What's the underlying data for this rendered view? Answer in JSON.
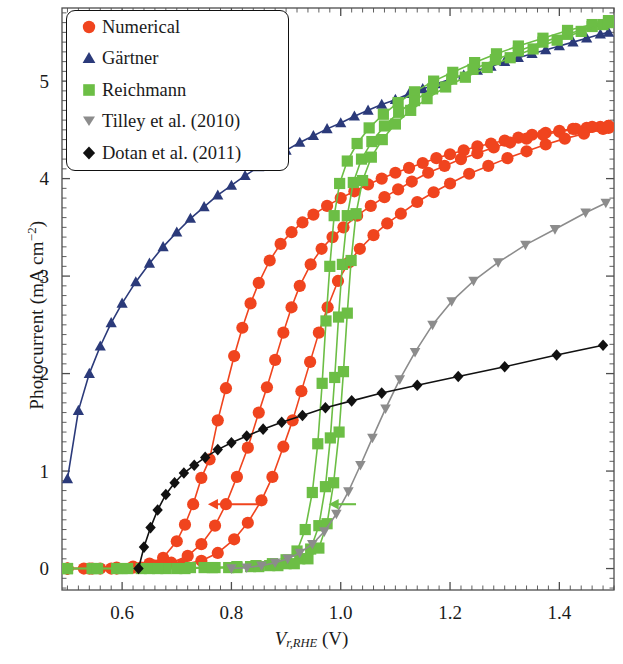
{
  "figure": {
    "kind": "scientific-plot",
    "background": "#ffffff",
    "frame_color": "#4d4d4d"
  },
  "axes": {
    "xlabel_prefix": "V",
    "xlabel_sub": "r,RHE",
    "xlabel_unit": "(V)",
    "ylabel_prefix": "Photocurrent (mA cm",
    "ylabel_sup": "−2",
    "ylabel_suffix": ")",
    "xticks": [
      "0.6",
      "0.8",
      "1.0",
      "1.2",
      "1.4"
    ],
    "yticks": [
      "0",
      "1",
      "2",
      "3",
      "4",
      "5"
    ]
  },
  "legend": {
    "items": [
      {
        "label": "Numerical",
        "marker": "circle-marker",
        "color": "#f0441e"
      },
      {
        "label": "Gärtner",
        "marker": "triangle-up-marker",
        "color": "#2b3a7a"
      },
      {
        "label": "Reichmann",
        "marker": "square-marker",
        "color": "#6cbe45"
      },
      {
        "label": "Tilley et al. (2010)",
        "marker": "triangle-down-marker",
        "color": "#8c8c8c"
      },
      {
        "label": "Dotan et al. (2011)",
        "marker": "diamond-marker",
        "color": "#111111"
      }
    ]
  },
  "chart_data": {
    "type": "line",
    "title": "",
    "xlabel": "V_{r,RHE} (V)",
    "ylabel": "Photocurrent (mA cm^-2)",
    "xlim": [
      0.49,
      1.5
    ],
    "ylim": [
      -0.22,
      5.75
    ],
    "grid": false,
    "legend_position": "top-left",
    "annotations": [
      {
        "name": "red-shift-arrow",
        "type": "arrow-left",
        "color": "#f0441e",
        "x_from": 0.862,
        "x_to": 0.757,
        "y": 0.66
      },
      {
        "name": "green-shift-arrow",
        "type": "arrow-left",
        "color": "#6cbe45",
        "x_from": 1.028,
        "x_to": 0.978,
        "y": 0.66
      }
    ],
    "series": [
      {
        "name": "Gärtner",
        "marker": "triangle-up-marker",
        "color": "#2b3a7a",
        "x": [
          0.5,
          0.52,
          0.54,
          0.56,
          0.58,
          0.6,
          0.625,
          0.65,
          0.675,
          0.7,
          0.725,
          0.75,
          0.775,
          0.8,
          0.825,
          0.85,
          0.875,
          0.9,
          0.925,
          0.95,
          0.975,
          1.0,
          1.025,
          1.05,
          1.075,
          1.1,
          1.125,
          1.15,
          1.175,
          1.2,
          1.225,
          1.25,
          1.275,
          1.3,
          1.325,
          1.35,
          1.375,
          1.4,
          1.425,
          1.45,
          1.475,
          1.49
        ],
        "y": [
          0.92,
          1.62,
          2.0,
          2.28,
          2.52,
          2.72,
          2.94,
          3.13,
          3.3,
          3.45,
          3.59,
          3.71,
          3.83,
          3.93,
          4.03,
          4.12,
          4.21,
          4.29,
          4.37,
          4.44,
          4.51,
          4.57,
          4.64,
          4.7,
          4.76,
          4.81,
          4.87,
          4.92,
          4.97,
          5.02,
          5.06,
          5.11,
          5.15,
          5.2,
          5.24,
          5.28,
          5.32,
          5.36,
          5.4,
          5.44,
          5.48,
          5.5
        ]
      },
      {
        "name": "Numerical-1",
        "marker": "circle-marker",
        "color": "#f0441e",
        "x": [
          0.5,
          0.53,
          0.56,
          0.59,
          0.62,
          0.65,
          0.675,
          0.7,
          0.715,
          0.73,
          0.745,
          0.76,
          0.775,
          0.79,
          0.805,
          0.82,
          0.835,
          0.85,
          0.87,
          0.89,
          0.91,
          0.93,
          0.95,
          0.975,
          1.0,
          1.025,
          1.05,
          1.075,
          1.1,
          1.125,
          1.15,
          1.175,
          1.2,
          1.225,
          1.25,
          1.275,
          1.3,
          1.325,
          1.35,
          1.375,
          1.4,
          1.425,
          1.45,
          1.475,
          1.49
        ],
        "y": [
          0.0,
          0.0,
          0.0,
          0.01,
          0.02,
          0.05,
          0.11,
          0.28,
          0.45,
          0.66,
          0.93,
          1.12,
          1.52,
          1.85,
          2.18,
          2.47,
          2.72,
          2.93,
          3.16,
          3.33,
          3.45,
          3.55,
          3.63,
          3.72,
          3.8,
          3.87,
          3.94,
          4.0,
          4.06,
          4.11,
          4.16,
          4.21,
          4.25,
          4.29,
          4.33,
          4.36,
          4.39,
          4.42,
          4.45,
          4.47,
          4.49,
          4.51,
          4.52,
          4.53,
          4.54
        ]
      },
      {
        "name": "Numerical-2",
        "marker": "circle-marker",
        "color": "#f0441e",
        "x": [
          0.5,
          0.54,
          0.58,
          0.62,
          0.66,
          0.69,
          0.72,
          0.745,
          0.77,
          0.79,
          0.81,
          0.83,
          0.85,
          0.865,
          0.88,
          0.895,
          0.91,
          0.925,
          0.945,
          0.965,
          0.985,
          1.005,
          1.03,
          1.055,
          1.08,
          1.105,
          1.13,
          1.16,
          1.19,
          1.22,
          1.25,
          1.28,
          1.31,
          1.34,
          1.37,
          1.4,
          1.43,
          1.46,
          1.49
        ],
        "y": [
          0.0,
          0.0,
          0.0,
          0.01,
          0.03,
          0.06,
          0.13,
          0.25,
          0.44,
          0.66,
          0.94,
          1.24,
          1.6,
          1.86,
          2.14,
          2.42,
          2.68,
          2.9,
          3.12,
          3.28,
          3.4,
          3.5,
          3.62,
          3.72,
          3.81,
          3.89,
          3.97,
          4.06,
          4.13,
          4.2,
          4.26,
          4.32,
          4.37,
          4.41,
          4.45,
          4.48,
          4.51,
          4.53,
          4.54
        ]
      },
      {
        "name": "Numerical-3",
        "marker": "circle-marker",
        "color": "#f0441e",
        "x": [
          0.5,
          0.545,
          0.59,
          0.635,
          0.675,
          0.71,
          0.745,
          0.775,
          0.805,
          0.83,
          0.855,
          0.875,
          0.895,
          0.912,
          0.928,
          0.944,
          0.96,
          0.976,
          0.995,
          1.015,
          1.035,
          1.06,
          1.085,
          1.11,
          1.14,
          1.17,
          1.2,
          1.235,
          1.27,
          1.305,
          1.34,
          1.375,
          1.41,
          1.445,
          1.48,
          1.49
        ],
        "y": [
          0.0,
          0.0,
          0.0,
          0.01,
          0.02,
          0.04,
          0.08,
          0.16,
          0.3,
          0.47,
          0.7,
          0.94,
          1.25,
          1.52,
          1.82,
          2.12,
          2.42,
          2.68,
          2.95,
          3.14,
          3.28,
          3.42,
          3.54,
          3.64,
          3.76,
          3.86,
          3.95,
          4.05,
          4.13,
          4.21,
          4.28,
          4.35,
          4.41,
          4.46,
          4.51,
          4.52
        ]
      },
      {
        "name": "Reichmann-1",
        "marker": "square-marker",
        "color": "#6cbe45",
        "x": [
          0.5,
          0.545,
          0.59,
          0.635,
          0.68,
          0.725,
          0.77,
          0.81,
          0.845,
          0.875,
          0.9,
          0.92,
          0.935,
          0.948,
          0.958,
          0.966,
          0.973,
          0.98,
          0.988,
          0.998,
          1.012,
          1.03,
          1.052,
          1.078,
          1.105,
          1.135,
          1.17,
          1.205,
          1.245,
          1.285,
          1.325,
          1.37,
          1.415,
          1.46,
          1.49
        ],
        "y": [
          0.0,
          0.0,
          0.0,
          0.0,
          0.0,
          0.01,
          0.01,
          0.02,
          0.03,
          0.05,
          0.09,
          0.18,
          0.4,
          0.78,
          1.28,
          1.9,
          2.54,
          3.1,
          3.62,
          3.95,
          4.18,
          4.36,
          4.52,
          4.66,
          4.78,
          4.89,
          5.0,
          5.09,
          5.19,
          5.28,
          5.36,
          5.44,
          5.52,
          5.58,
          5.62
        ]
      },
      {
        "name": "Reichmann-2",
        "marker": "square-marker",
        "color": "#6cbe45",
        "x": [
          0.5,
          0.55,
          0.6,
          0.65,
          0.7,
          0.75,
          0.795,
          0.835,
          0.87,
          0.9,
          0.925,
          0.945,
          0.96,
          0.972,
          0.981,
          0.989,
          0.996,
          1.003,
          1.012,
          1.023,
          1.038,
          1.057,
          1.08,
          1.106,
          1.135,
          1.168,
          1.203,
          1.242,
          1.283,
          1.325,
          1.37,
          1.415,
          1.46,
          1.49
        ],
        "y": [
          0.0,
          0.0,
          0.0,
          0.0,
          0.0,
          0.01,
          0.01,
          0.02,
          0.03,
          0.05,
          0.1,
          0.2,
          0.44,
          0.84,
          1.34,
          1.96,
          2.58,
          3.12,
          3.62,
          3.96,
          4.2,
          4.38,
          4.54,
          4.68,
          4.8,
          4.92,
          5.02,
          5.12,
          5.22,
          5.31,
          5.4,
          5.48,
          5.56,
          5.62
        ]
      },
      {
        "name": "Reichmann-3",
        "marker": "square-marker",
        "color": "#6cbe45",
        "x": [
          0.5,
          0.555,
          0.61,
          0.665,
          0.715,
          0.765,
          0.81,
          0.85,
          0.885,
          0.915,
          0.94,
          0.96,
          0.975,
          0.987,
          0.997,
          1.005,
          1.012,
          1.019,
          1.028,
          1.04,
          1.056,
          1.076,
          1.1,
          1.128,
          1.158,
          1.192,
          1.228,
          1.268,
          1.31,
          1.352,
          1.396,
          1.44,
          1.48,
          1.49
        ],
        "y": [
          0.0,
          0.0,
          0.0,
          0.0,
          0.0,
          0.01,
          0.01,
          0.02,
          0.03,
          0.05,
          0.1,
          0.21,
          0.46,
          0.88,
          1.4,
          2.02,
          2.62,
          3.16,
          3.64,
          3.98,
          4.22,
          4.4,
          4.56,
          4.7,
          4.82,
          4.94,
          5.04,
          5.14,
          5.24,
          5.33,
          5.42,
          5.51,
          5.58,
          5.6
        ]
      },
      {
        "name": "Tilley et al. (2010)",
        "marker": "triangle-down-marker",
        "color": "#8c8c8c",
        "x": [
          0.8,
          0.828,
          0.855,
          0.88,
          0.903,
          0.925,
          0.948,
          0.97,
          0.992,
          1.014,
          1.036,
          1.058,
          1.082,
          1.108,
          1.136,
          1.168,
          1.203,
          1.243,
          1.288,
          1.338,
          1.392,
          1.448,
          1.485
        ],
        "y": [
          0.0,
          0.01,
          0.03,
          0.06,
          0.1,
          0.16,
          0.25,
          0.38,
          0.56,
          0.79,
          1.06,
          1.34,
          1.64,
          1.94,
          2.22,
          2.5,
          2.74,
          2.95,
          3.14,
          3.32,
          3.48,
          3.65,
          3.75
        ]
      },
      {
        "name": "Dotan et al. (2011)",
        "marker": "diamond-marker",
        "color": "#111111",
        "x": [
          0.63,
          0.64,
          0.652,
          0.665,
          0.68,
          0.696,
          0.713,
          0.732,
          0.752,
          0.775,
          0.8,
          0.828,
          0.858,
          0.892,
          0.93,
          0.972,
          1.02,
          1.075,
          1.14,
          1.215,
          1.3,
          1.395,
          1.48
        ],
        "y": [
          0.0,
          0.22,
          0.42,
          0.6,
          0.76,
          0.88,
          0.98,
          1.06,
          1.14,
          1.22,
          1.29,
          1.36,
          1.43,
          1.5,
          1.57,
          1.65,
          1.72,
          1.8,
          1.88,
          1.97,
          2.07,
          2.19,
          2.29
        ]
      }
    ]
  }
}
